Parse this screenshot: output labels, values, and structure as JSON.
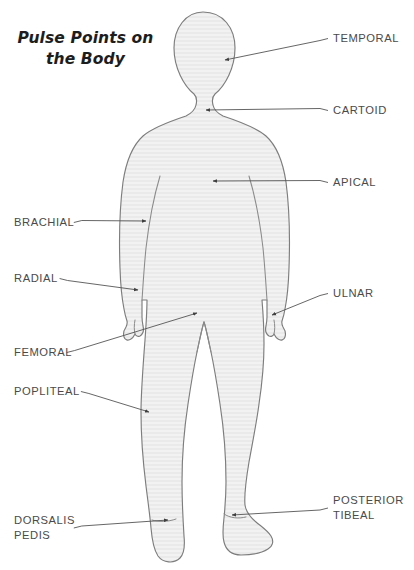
{
  "title": "Pulse Points on\nthe Body",
  "background_color": "#ffffff",
  "figure": {
    "name": "human-body-silhouette",
    "fill_color": "#f0f0f0",
    "stroke_color": "#7a7a7a",
    "texture": "horizontal-stripes"
  },
  "leader_line_color": "#555555",
  "label_color": "#4a4a4a",
  "labels": [
    {
      "id": "temporal",
      "text": "TEMPORAL",
      "side": "right",
      "text_x": 333,
      "text_y": 31,
      "target_x": 225,
      "target_y": 60
    },
    {
      "id": "cartoid",
      "text": "CARTOID",
      "side": "right",
      "text_x": 333,
      "text_y": 103,
      "target_x": 206,
      "target_y": 110
    },
    {
      "id": "apical",
      "text": "APICAL",
      "side": "right",
      "text_x": 333,
      "text_y": 175,
      "target_x": 213,
      "target_y": 181
    },
    {
      "id": "ulnar",
      "text": "ULNAR",
      "side": "right",
      "text_x": 333,
      "text_y": 286,
      "target_x": 272,
      "target_y": 315
    },
    {
      "id": "posterior-tibeal",
      "text": "POSTERIOR\nTIBEAL",
      "side": "right",
      "text_x": 333,
      "text_y": 493,
      "target_x": 232,
      "target_y": 515
    },
    {
      "id": "brachial",
      "text": "BRACHIAL",
      "side": "left",
      "text_x": 14,
      "text_y": 215,
      "target_x": 146,
      "target_y": 221
    },
    {
      "id": "radial",
      "text": "RADIAL",
      "side": "left",
      "text_x": 14,
      "text_y": 271,
      "target_x": 138,
      "target_y": 290
    },
    {
      "id": "femoral",
      "text": "FEMORAL",
      "side": "left",
      "text_x": 14,
      "text_y": 345,
      "target_x": 197,
      "target_y": 313
    },
    {
      "id": "popliteal",
      "text": "POPLITEAL",
      "side": "left",
      "text_x": 14,
      "text_y": 384,
      "target_x": 149,
      "target_y": 412
    },
    {
      "id": "dorsalis-pedis",
      "text": "DORSALIS\nPEDIS",
      "side": "left",
      "text_x": 14,
      "text_y": 513,
      "target_x": 168,
      "target_y": 520
    }
  ]
}
